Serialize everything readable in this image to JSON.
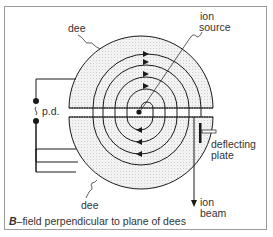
{
  "diagram": {
    "labels": {
      "dee_top": "dee",
      "dee_bottom": "dee",
      "ion_source_line1": "ion",
      "ion_source_line2": "source",
      "pd": "p.d.",
      "deflecting_line1": "deflecting",
      "deflecting_line2": "plate",
      "ion_beam_line1": "ion",
      "ion_beam_line2": "beam"
    },
    "caption": {
      "bold": "B",
      "text": "–field perpendicular to plane of dees"
    },
    "colors": {
      "line": "#1a1a1a",
      "dee_fill": "#ececec",
      "frame": "#9a9a9a",
      "text": "#333333"
    }
  }
}
